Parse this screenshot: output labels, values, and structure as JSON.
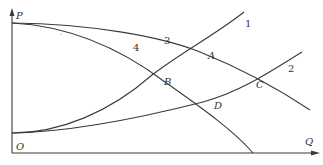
{
  "axes": {
    "y_label": "P",
    "x_label": "Q",
    "origin_label": "O"
  },
  "curves": [
    {
      "id": "1",
      "label": "1",
      "description": "rising curve from low P-intercept, steep"
    },
    {
      "id": "2",
      "label": "2",
      "description": "rising curve from low P-intercept, gentle"
    },
    {
      "id": "3",
      "label": "3",
      "description": "falling curve from high P-intercept, gentle"
    },
    {
      "id": "4",
      "label": "4",
      "description": "falling curve from high P-intercept, steep"
    }
  ],
  "points": [
    {
      "id": "A",
      "label": "A",
      "intersection": [
        "1",
        "3"
      ]
    },
    {
      "id": "B",
      "label": "B",
      "intersection": [
        "1",
        "4"
      ]
    },
    {
      "id": "C",
      "label": "C",
      "intersection": [
        "2",
        "3"
      ]
    },
    {
      "id": "D",
      "label": "D",
      "intersection": [
        "2",
        "4"
      ]
    }
  ],
  "colors": {
    "line": "#3a3a3a",
    "background": "#ffffff"
  }
}
